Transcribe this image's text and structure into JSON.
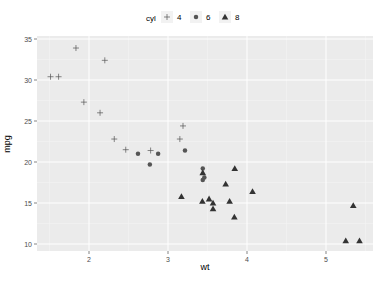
{
  "chart_data": {
    "type": "scatter",
    "title": "",
    "xlabel": "wt",
    "ylabel": "mpg",
    "xlim": [
      1.4,
      5.5
    ],
    "ylim": [
      9.2,
      35.4
    ],
    "xticks": [
      2,
      3,
      4,
      5
    ],
    "yticks": [
      10,
      15,
      20,
      25,
      30,
      35
    ],
    "grid": true,
    "legend": {
      "title": "cyl",
      "position": "top",
      "entries": [
        "4",
        "6",
        "8"
      ]
    },
    "series": [
      {
        "name": "4",
        "shape": "cross",
        "points": [
          [
            2.32,
            22.8
          ],
          [
            3.19,
            24.4
          ],
          [
            3.15,
            22.8
          ],
          [
            2.2,
            32.4
          ],
          [
            1.615,
            30.4
          ],
          [
            1.835,
            33.9
          ],
          [
            2.465,
            21.5
          ],
          [
            1.935,
            27.3
          ],
          [
            2.14,
            26.0
          ],
          [
            1.513,
            30.4
          ],
          [
            2.78,
            21.4
          ]
        ]
      },
      {
        "name": "6",
        "shape": "circle",
        "points": [
          [
            2.62,
            21.0
          ],
          [
            2.875,
            21.0
          ],
          [
            3.215,
            21.4
          ],
          [
            3.46,
            18.1
          ],
          [
            3.44,
            19.2
          ],
          [
            3.44,
            17.8
          ],
          [
            2.77,
            19.7
          ]
        ]
      },
      {
        "name": "8",
        "shape": "triangle",
        "points": [
          [
            3.44,
            18.7
          ],
          [
            3.57,
            14.3
          ],
          [
            4.07,
            16.4
          ],
          [
            3.73,
            17.3
          ],
          [
            3.78,
            15.2
          ],
          [
            5.25,
            10.4
          ],
          [
            5.424,
            10.4
          ],
          [
            5.345,
            14.7
          ],
          [
            3.52,
            15.5
          ],
          [
            3.435,
            15.2
          ],
          [
            3.84,
            13.3
          ],
          [
            3.845,
            19.2
          ],
          [
            3.17,
            15.8
          ],
          [
            3.57,
            15.0
          ]
        ]
      }
    ]
  }
}
